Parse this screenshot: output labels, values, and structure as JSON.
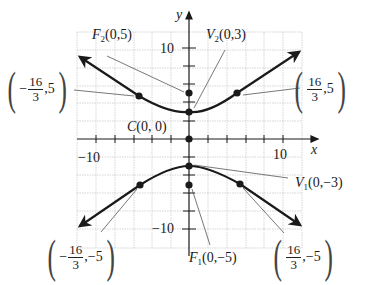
{
  "axes": {
    "x_label": "x",
    "y_label": "y",
    "x_tick_labels": [
      "−10",
      "10"
    ],
    "y_tick_labels": [
      "10",
      "−10"
    ],
    "tick_step": 2,
    "range": [
      -12,
      12
    ]
  },
  "labels": {
    "F2": {
      "letter": "F",
      "sub": "2",
      "coords": "(0,5)"
    },
    "V2": {
      "letter": "V",
      "sub": "2",
      "coords": "(0,3)"
    },
    "C": {
      "letter": "C",
      "coords": "(0, 0)"
    },
    "V1": {
      "letter": "V",
      "sub": "1",
      "coords": "(0,−3)"
    },
    "F1": {
      "letter": "F",
      "sub": "1",
      "coords": "(0,−5)"
    },
    "p_ul": {
      "sign": "−",
      "num": "16",
      "den": "3",
      "y": ",5"
    },
    "p_ur": {
      "sign": "",
      "num": "16",
      "den": "3",
      "y": ",5"
    },
    "p_ll": {
      "sign": "−",
      "num": "16",
      "den": "3",
      "y": ",−5"
    },
    "p_lr": {
      "sign": "",
      "num": "16",
      "den": "3",
      "y": ",−5"
    },
    "paren_open": "(",
    "paren_close": ")"
  },
  "hyperbola": {
    "equation": "y^2/9 - x^2/16 = 1",
    "center": [
      0,
      0
    ],
    "vertices": [
      [
        0,
        3
      ],
      [
        0,
        -3
      ]
    ],
    "foci": [
      [
        0,
        5
      ],
      [
        0,
        -5
      ]
    ],
    "latus_rectum_endpoints": [
      [
        "-16/3",
        5
      ],
      [
        "16/3",
        5
      ],
      [
        "-16/3",
        -5
      ],
      [
        "16/3",
        -5
      ]
    ]
  },
  "colors": {
    "curve": "#1a1a1a",
    "grid": "#bdbdbd",
    "leader": "#555555"
  }
}
